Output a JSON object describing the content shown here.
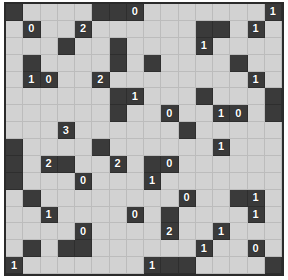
{
  "puzzle": {
    "title": "minesweeper-grid",
    "rows": 16,
    "cols": 16,
    "colors": {
      "dark_cell": "#3a3a3a",
      "light_cell": "#d2d2d2",
      "grid_line": "#8a8a8a",
      "frame": "#2b2b2b",
      "page_background": "#ffffff",
      "number_text": "#ffffff"
    },
    "legend": {
      "dark": "revealed/clue cell",
      "light": "covered cell",
      "number": "adjacent mine count"
    },
    "cells": [
      [
        {
          "state": "dark",
          "value": ""
        },
        {
          "state": "light",
          "value": ""
        },
        {
          "state": "light",
          "value": ""
        },
        {
          "state": "light",
          "value": ""
        },
        {
          "state": "light",
          "value": ""
        },
        {
          "state": "dark",
          "value": ""
        },
        {
          "state": "dark",
          "value": ""
        },
        {
          "state": "dark",
          "value": "0"
        },
        {
          "state": "light",
          "value": ""
        },
        {
          "state": "light",
          "value": ""
        },
        {
          "state": "light",
          "value": ""
        },
        {
          "state": "light",
          "value": ""
        },
        {
          "state": "light",
          "value": ""
        },
        {
          "state": "light",
          "value": ""
        },
        {
          "state": "light",
          "value": ""
        },
        {
          "state": "dark",
          "value": "1"
        }
      ],
      [
        {
          "state": "light",
          "value": ""
        },
        {
          "state": "dark",
          "value": "0"
        },
        {
          "state": "light",
          "value": ""
        },
        {
          "state": "light",
          "value": ""
        },
        {
          "state": "dark",
          "value": "2"
        },
        {
          "state": "light",
          "value": ""
        },
        {
          "state": "light",
          "value": ""
        },
        {
          "state": "light",
          "value": ""
        },
        {
          "state": "light",
          "value": ""
        },
        {
          "state": "light",
          "value": ""
        },
        {
          "state": "light",
          "value": ""
        },
        {
          "state": "dark",
          "value": ""
        },
        {
          "state": "dark",
          "value": ""
        },
        {
          "state": "light",
          "value": ""
        },
        {
          "state": "dark",
          "value": "1"
        },
        {
          "state": "light",
          "value": ""
        }
      ],
      [
        {
          "state": "light",
          "value": ""
        },
        {
          "state": "light",
          "value": ""
        },
        {
          "state": "light",
          "value": ""
        },
        {
          "state": "dark",
          "value": ""
        },
        {
          "state": "light",
          "value": ""
        },
        {
          "state": "light",
          "value": ""
        },
        {
          "state": "dark",
          "value": ""
        },
        {
          "state": "light",
          "value": ""
        },
        {
          "state": "light",
          "value": ""
        },
        {
          "state": "light",
          "value": ""
        },
        {
          "state": "light",
          "value": ""
        },
        {
          "state": "dark",
          "value": "1"
        },
        {
          "state": "light",
          "value": ""
        },
        {
          "state": "light",
          "value": ""
        },
        {
          "state": "light",
          "value": ""
        },
        {
          "state": "light",
          "value": ""
        }
      ],
      [
        {
          "state": "light",
          "value": ""
        },
        {
          "state": "dark",
          "value": ""
        },
        {
          "state": "light",
          "value": ""
        },
        {
          "state": "light",
          "value": ""
        },
        {
          "state": "light",
          "value": ""
        },
        {
          "state": "light",
          "value": ""
        },
        {
          "state": "dark",
          "value": ""
        },
        {
          "state": "light",
          "value": ""
        },
        {
          "state": "dark",
          "value": ""
        },
        {
          "state": "light",
          "value": ""
        },
        {
          "state": "light",
          "value": ""
        },
        {
          "state": "light",
          "value": ""
        },
        {
          "state": "light",
          "value": ""
        },
        {
          "state": "dark",
          "value": ""
        },
        {
          "state": "light",
          "value": ""
        },
        {
          "state": "light",
          "value": ""
        }
      ],
      [
        {
          "state": "light",
          "value": ""
        },
        {
          "state": "dark",
          "value": "1"
        },
        {
          "state": "dark",
          "value": "0"
        },
        {
          "state": "light",
          "value": ""
        },
        {
          "state": "light",
          "value": ""
        },
        {
          "state": "dark",
          "value": "2"
        },
        {
          "state": "light",
          "value": ""
        },
        {
          "state": "light",
          "value": ""
        },
        {
          "state": "light",
          "value": ""
        },
        {
          "state": "light",
          "value": ""
        },
        {
          "state": "light",
          "value": ""
        },
        {
          "state": "light",
          "value": ""
        },
        {
          "state": "light",
          "value": ""
        },
        {
          "state": "light",
          "value": ""
        },
        {
          "state": "dark",
          "value": "1"
        },
        {
          "state": "light",
          "value": ""
        }
      ],
      [
        {
          "state": "light",
          "value": ""
        },
        {
          "state": "light",
          "value": ""
        },
        {
          "state": "light",
          "value": ""
        },
        {
          "state": "light",
          "value": ""
        },
        {
          "state": "light",
          "value": ""
        },
        {
          "state": "light",
          "value": ""
        },
        {
          "state": "dark",
          "value": ""
        },
        {
          "state": "dark",
          "value": "1"
        },
        {
          "state": "light",
          "value": ""
        },
        {
          "state": "light",
          "value": ""
        },
        {
          "state": "light",
          "value": ""
        },
        {
          "state": "dark",
          "value": ""
        },
        {
          "state": "light",
          "value": ""
        },
        {
          "state": "light",
          "value": ""
        },
        {
          "state": "light",
          "value": ""
        },
        {
          "state": "dark",
          "value": ""
        }
      ],
      [
        {
          "state": "light",
          "value": ""
        },
        {
          "state": "light",
          "value": ""
        },
        {
          "state": "light",
          "value": ""
        },
        {
          "state": "light",
          "value": ""
        },
        {
          "state": "light",
          "value": ""
        },
        {
          "state": "light",
          "value": ""
        },
        {
          "state": "dark",
          "value": ""
        },
        {
          "state": "light",
          "value": ""
        },
        {
          "state": "light",
          "value": ""
        },
        {
          "state": "dark",
          "value": "0"
        },
        {
          "state": "light",
          "value": ""
        },
        {
          "state": "light",
          "value": ""
        },
        {
          "state": "dark",
          "value": "1"
        },
        {
          "state": "dark",
          "value": "0"
        },
        {
          "state": "light",
          "value": ""
        },
        {
          "state": "dark",
          "value": ""
        }
      ],
      [
        {
          "state": "light",
          "value": ""
        },
        {
          "state": "light",
          "value": ""
        },
        {
          "state": "light",
          "value": ""
        },
        {
          "state": "dark",
          "value": "3"
        },
        {
          "state": "light",
          "value": ""
        },
        {
          "state": "light",
          "value": ""
        },
        {
          "state": "light",
          "value": ""
        },
        {
          "state": "light",
          "value": ""
        },
        {
          "state": "light",
          "value": ""
        },
        {
          "state": "light",
          "value": ""
        },
        {
          "state": "dark",
          "value": ""
        },
        {
          "state": "light",
          "value": ""
        },
        {
          "state": "light",
          "value": ""
        },
        {
          "state": "light",
          "value": ""
        },
        {
          "state": "light",
          "value": ""
        },
        {
          "state": "light",
          "value": ""
        }
      ],
      [
        {
          "state": "dark",
          "value": ""
        },
        {
          "state": "light",
          "value": ""
        },
        {
          "state": "light",
          "value": ""
        },
        {
          "state": "light",
          "value": ""
        },
        {
          "state": "light",
          "value": ""
        },
        {
          "state": "dark",
          "value": ""
        },
        {
          "state": "light",
          "value": ""
        },
        {
          "state": "light",
          "value": ""
        },
        {
          "state": "light",
          "value": ""
        },
        {
          "state": "light",
          "value": ""
        },
        {
          "state": "light",
          "value": ""
        },
        {
          "state": "light",
          "value": ""
        },
        {
          "state": "dark",
          "value": "1"
        },
        {
          "state": "light",
          "value": ""
        },
        {
          "state": "light",
          "value": ""
        },
        {
          "state": "light",
          "value": ""
        }
      ],
      [
        {
          "state": "dark",
          "value": ""
        },
        {
          "state": "light",
          "value": ""
        },
        {
          "state": "dark",
          "value": "2"
        },
        {
          "state": "dark",
          "value": ""
        },
        {
          "state": "light",
          "value": ""
        },
        {
          "state": "light",
          "value": ""
        },
        {
          "state": "dark",
          "value": "2"
        },
        {
          "state": "light",
          "value": ""
        },
        {
          "state": "dark",
          "value": ""
        },
        {
          "state": "dark",
          "value": "0"
        },
        {
          "state": "light",
          "value": ""
        },
        {
          "state": "light",
          "value": ""
        },
        {
          "state": "light",
          "value": ""
        },
        {
          "state": "light",
          "value": ""
        },
        {
          "state": "light",
          "value": ""
        },
        {
          "state": "light",
          "value": ""
        }
      ],
      [
        {
          "state": "dark",
          "value": ""
        },
        {
          "state": "light",
          "value": ""
        },
        {
          "state": "light",
          "value": ""
        },
        {
          "state": "light",
          "value": ""
        },
        {
          "state": "dark",
          "value": "0"
        },
        {
          "state": "light",
          "value": ""
        },
        {
          "state": "light",
          "value": ""
        },
        {
          "state": "light",
          "value": ""
        },
        {
          "state": "dark",
          "value": "1"
        },
        {
          "state": "light",
          "value": ""
        },
        {
          "state": "light",
          "value": ""
        },
        {
          "state": "light",
          "value": ""
        },
        {
          "state": "light",
          "value": ""
        },
        {
          "state": "light",
          "value": ""
        },
        {
          "state": "light",
          "value": ""
        },
        {
          "state": "light",
          "value": ""
        }
      ],
      [
        {
          "state": "light",
          "value": ""
        },
        {
          "state": "dark",
          "value": ""
        },
        {
          "state": "light",
          "value": ""
        },
        {
          "state": "light",
          "value": ""
        },
        {
          "state": "light",
          "value": ""
        },
        {
          "state": "light",
          "value": ""
        },
        {
          "state": "light",
          "value": ""
        },
        {
          "state": "light",
          "value": ""
        },
        {
          "state": "light",
          "value": ""
        },
        {
          "state": "light",
          "value": ""
        },
        {
          "state": "dark",
          "value": "0"
        },
        {
          "state": "light",
          "value": ""
        },
        {
          "state": "light",
          "value": ""
        },
        {
          "state": "dark",
          "value": ""
        },
        {
          "state": "dark",
          "value": "1"
        },
        {
          "state": "light",
          "value": ""
        }
      ],
      [
        {
          "state": "light",
          "value": ""
        },
        {
          "state": "light",
          "value": ""
        },
        {
          "state": "dark",
          "value": "1"
        },
        {
          "state": "light",
          "value": ""
        },
        {
          "state": "light",
          "value": ""
        },
        {
          "state": "light",
          "value": ""
        },
        {
          "state": "light",
          "value": ""
        },
        {
          "state": "dark",
          "value": "0"
        },
        {
          "state": "light",
          "value": ""
        },
        {
          "state": "dark",
          "value": ""
        },
        {
          "state": "light",
          "value": ""
        },
        {
          "state": "light",
          "value": ""
        },
        {
          "state": "light",
          "value": ""
        },
        {
          "state": "light",
          "value": ""
        },
        {
          "state": "dark",
          "value": "1"
        },
        {
          "state": "light",
          "value": ""
        }
      ],
      [
        {
          "state": "light",
          "value": ""
        },
        {
          "state": "light",
          "value": ""
        },
        {
          "state": "light",
          "value": ""
        },
        {
          "state": "light",
          "value": ""
        },
        {
          "state": "dark",
          "value": "0"
        },
        {
          "state": "light",
          "value": ""
        },
        {
          "state": "light",
          "value": ""
        },
        {
          "state": "light",
          "value": ""
        },
        {
          "state": "light",
          "value": ""
        },
        {
          "state": "dark",
          "value": "2"
        },
        {
          "state": "light",
          "value": ""
        },
        {
          "state": "light",
          "value": ""
        },
        {
          "state": "dark",
          "value": "1"
        },
        {
          "state": "light",
          "value": ""
        },
        {
          "state": "light",
          "value": ""
        },
        {
          "state": "light",
          "value": ""
        }
      ],
      [
        {
          "state": "light",
          "value": ""
        },
        {
          "state": "dark",
          "value": ""
        },
        {
          "state": "light",
          "value": ""
        },
        {
          "state": "dark",
          "value": ""
        },
        {
          "state": "dark",
          "value": ""
        },
        {
          "state": "light",
          "value": ""
        },
        {
          "state": "light",
          "value": ""
        },
        {
          "state": "light",
          "value": ""
        },
        {
          "state": "light",
          "value": ""
        },
        {
          "state": "light",
          "value": ""
        },
        {
          "state": "light",
          "value": ""
        },
        {
          "state": "dark",
          "value": "1"
        },
        {
          "state": "light",
          "value": ""
        },
        {
          "state": "light",
          "value": ""
        },
        {
          "state": "dark",
          "value": "0"
        },
        {
          "state": "light",
          "value": ""
        }
      ],
      [
        {
          "state": "dark",
          "value": "1"
        },
        {
          "state": "light",
          "value": ""
        },
        {
          "state": "light",
          "value": ""
        },
        {
          "state": "light",
          "value": ""
        },
        {
          "state": "light",
          "value": ""
        },
        {
          "state": "light",
          "value": ""
        },
        {
          "state": "light",
          "value": ""
        },
        {
          "state": "light",
          "value": ""
        },
        {
          "state": "dark",
          "value": "1"
        },
        {
          "state": "dark",
          "value": ""
        },
        {
          "state": "dark",
          "value": ""
        },
        {
          "state": "light",
          "value": ""
        },
        {
          "state": "light",
          "value": ""
        },
        {
          "state": "light",
          "value": ""
        },
        {
          "state": "light",
          "value": ""
        },
        {
          "state": "dark",
          "value": ""
        }
      ]
    ]
  }
}
